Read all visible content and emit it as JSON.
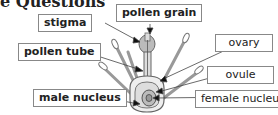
{
  "heading": "e Questions",
  "labels": {
    "stigma": "stigma",
    "pollen_grain": "pollen grain",
    "pollen_tube": "pollen tube",
    "ovary": "ovary",
    "ovule": "ovule",
    "male_nucleus": "male nucleus",
    "female_nucleus": "female nucleus"
  }
}
